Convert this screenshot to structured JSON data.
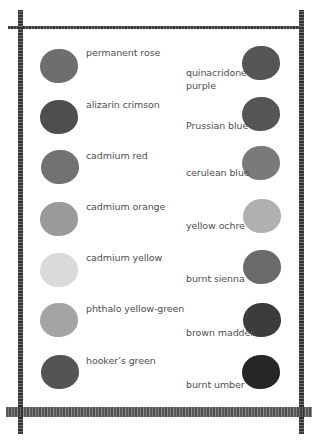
{
  "frame": {
    "color": "#4a4a4a"
  },
  "left_column": [
    {
      "label": "permanent rose",
      "swatch_color": "#6e6e6e"
    },
    {
      "label": "alizarin crimson",
      "swatch_color": "#4e4e4e"
    },
    {
      "label": "cadmium red",
      "swatch_color": "#727272"
    },
    {
      "label": "cadmium orange",
      "swatch_color": "#9a9a9a"
    },
    {
      "label": "cadmium yellow",
      "swatch_color": "#dadada"
    },
    {
      "label": "phthalo yellow-green",
      "swatch_color": "#a4a4a4"
    },
    {
      "label": "hooker’s green",
      "swatch_color": "#545454"
    }
  ],
  "right_column": [
    {
      "label": "quinacridone purple",
      "swatch_color": "#555555"
    },
    {
      "label": "Prussian blue",
      "swatch_color": "#555555"
    },
    {
      "label": "cerulean blue",
      "swatch_color": "#7a7a7a"
    },
    {
      "label": "yellow ochre",
      "swatch_color": "#b0b0b0"
    },
    {
      "label": "burnt sienna",
      "swatch_color": "#6a6a6a"
    },
    {
      "label": "brown madder",
      "swatch_color": "#3c3c3c"
    },
    {
      "label": "burnt umber",
      "swatch_color": "#262626"
    }
  ]
}
